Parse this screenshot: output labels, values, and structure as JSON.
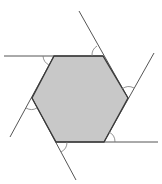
{
  "diagram": {
    "shape": "hexagon",
    "colors": {
      "fill": "#c8c8c8",
      "edge": "#3a3a3a",
      "extension": "#555555",
      "arc": "#777777",
      "background": "#ffffff"
    },
    "vertices": [
      {
        "id": "A",
        "x": 54,
        "y": 56
      },
      {
        "id": "B",
        "x": 103,
        "y": 56
      },
      {
        "id": "C",
        "x": 128,
        "y": 98
      },
      {
        "id": "D",
        "x": 104,
        "y": 142
      },
      {
        "id": "E",
        "x": 56,
        "y": 142
      },
      {
        "id": "F",
        "x": 32,
        "y": 98
      }
    ],
    "extended_sides": [
      {
        "from": [
          4,
          56
        ],
        "to": [
          103,
          56
        ]
      },
      {
        "from": [
          79,
          11
        ],
        "to": [
          128,
          98
        ]
      },
      {
        "from": [
          154,
          53
        ],
        "to": [
          104,
          142
        ]
      },
      {
        "from": [
          56,
          142
        ],
        "to": [
          158,
          142
        ]
      },
      {
        "from": [
          76,
          180
        ],
        "to": [
          32,
          98
        ]
      },
      {
        "from": [
          10,
          137
        ],
        "to": [
          54,
          56
        ]
      }
    ],
    "exterior_angle_marks": 6
  }
}
